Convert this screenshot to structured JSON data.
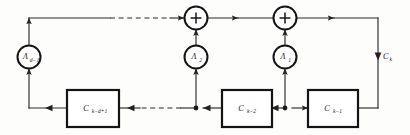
{
  "figure": {
    "name": "recursive-filter-signal-flow-graph",
    "kind": "signal-flow-diagram",
    "width": 410,
    "height": 135,
    "background_color": "#fdfdfc",
    "line_color": "#2b2b2b",
    "node_color": "#141414"
  },
  "multipliers": [
    {
      "id": "lambda-d-minus-1",
      "base": "Λ",
      "subscript": "d−1",
      "cx": 29,
      "cy": 57,
      "r": 11.5
    },
    {
      "id": "lambda-2",
      "base": "Λ",
      "subscript": "2",
      "cx": 196,
      "cy": 57,
      "r": 11.5
    },
    {
      "id": "lambda-1",
      "base": "Λ",
      "subscript": "1",
      "cx": 285,
      "cy": 57,
      "r": 11.5
    }
  ],
  "adders": [
    {
      "id": "adder-left",
      "symbol": "+",
      "cx": 196,
      "cy": 18,
      "r": 11.5
    },
    {
      "id": "adder-right",
      "symbol": "+",
      "cx": 285,
      "cy": 18,
      "r": 11.5
    }
  ],
  "delay_boxes": [
    {
      "id": "box-c-k-d-plus-1",
      "base": "C",
      "subscript": "k−d+1",
      "x": 67,
      "y": 90,
      "w": 52,
      "h": 37
    },
    {
      "id": "box-c-k-2",
      "base": "C",
      "subscript": "k−2",
      "x": 222,
      "y": 90,
      "w": 50,
      "h": 37
    },
    {
      "id": "box-c-k-1",
      "base": "C",
      "subscript": "k−1",
      "x": 308,
      "y": 90,
      "w": 50,
      "h": 37
    }
  ],
  "junctions": [
    {
      "id": "junction-c-k-2-tap",
      "cx": 196,
      "cy": 108,
      "r": 2.4
    },
    {
      "id": "junction-c-k-1-tap",
      "cx": 285,
      "cy": 108,
      "r": 2.4
    }
  ],
  "output": {
    "id": "output-c-k",
    "base": "C",
    "subscript": "k",
    "x": 382,
    "y": 57
  },
  "labels": {
    "lambda_d_minus_1": "Λd−1",
    "lambda_2": "Λ2",
    "lambda_1": "Λ1",
    "adder_left": "+",
    "adder_right": "+",
    "box_1": "Ck−d+1",
    "box_2": "Ck−2",
    "box_3": "Ck−1",
    "output": "Ck"
  },
  "geometry": {
    "top_bus_y": 18,
    "bottom_bus_y": 108,
    "left_riser_x": 29,
    "right_riser_x": 378,
    "top_dashed_start_x": 110,
    "top_dashed_end_x": 172,
    "bottom_dashed_start_x": 135,
    "bottom_dashed_end_x": 178
  }
}
